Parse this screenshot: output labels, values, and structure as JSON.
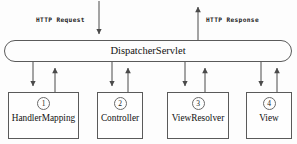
{
  "diagram": {
    "colors": {
      "stroke": "#5a5a5a",
      "arrow": "#4a4a4a",
      "text": "#111111",
      "background": "#fdfdfd"
    },
    "flow_labels": {
      "request": "HTTP Request",
      "response": "HTTP Response"
    },
    "dispatcher": {
      "label": "DispatcherServlet"
    },
    "components": [
      {
        "step": "1",
        "label": "HandlerMapping"
      },
      {
        "step": "2",
        "label": "Controller"
      },
      {
        "step": "3",
        "label": "ViewResolver"
      },
      {
        "step": "4",
        "label": "View"
      }
    ]
  }
}
